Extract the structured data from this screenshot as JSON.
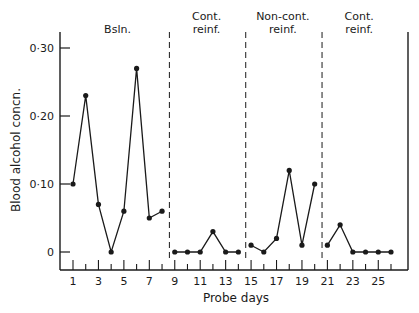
{
  "chart_data": {
    "type": "line",
    "title": "",
    "xlabel": "Probe days",
    "ylabel": "Blood alcohol concn.",
    "ylim": [
      0,
      0.3
    ],
    "xlim": [
      1,
      26
    ],
    "y_ticks": [
      0,
      0.1,
      0.2,
      0.3
    ],
    "y_tick_labels": [
      "0",
      "0·10",
      "0·20",
      "0·30"
    ],
    "x_tick_labels": [
      "1",
      "3",
      "5",
      "7",
      "9",
      "11",
      "13",
      "15",
      "17",
      "19",
      "21",
      "23",
      "25"
    ],
    "grid": false,
    "legend": null,
    "phases": [
      {
        "label_line1": "Bsln.",
        "label_line2": "",
        "days": [
          1,
          8
        ]
      },
      {
        "label_line1": "Cont.",
        "label_line2": "reinf.",
        "days": [
          9,
          14
        ]
      },
      {
        "label_line1": "Non-cont.",
        "label_line2": "reinf.",
        "days": [
          15,
          20
        ]
      },
      {
        "label_line1": "Cont.",
        "label_line2": "reinf.",
        "days": [
          21,
          26
        ]
      }
    ],
    "phase_dividers_after_day": [
      8.5,
      14.5,
      20.5
    ],
    "series": [
      {
        "name": "Bsln.",
        "x": [
          1,
          2,
          3,
          4,
          5,
          6,
          7,
          8
        ],
        "values": [
          0.1,
          0.23,
          0.07,
          0.0,
          0.06,
          0.27,
          0.05,
          0.06
        ]
      },
      {
        "name": "Cont. reinf. (1)",
        "x": [
          9,
          10,
          11,
          12,
          13,
          14
        ],
        "values": [
          0.0,
          0.0,
          0.0,
          0.03,
          0.0,
          0.0
        ]
      },
      {
        "name": "Non-cont. reinf.",
        "x": [
          15,
          16,
          17,
          18,
          19,
          20
        ],
        "values": [
          0.01,
          0.0,
          0.02,
          0.12,
          0.01,
          0.1
        ]
      },
      {
        "name": "Cont. reinf. (2)",
        "x": [
          21,
          22,
          23,
          24,
          25,
          26
        ],
        "values": [
          0.01,
          0.04,
          0.0,
          0.0,
          0.0,
          0.0
        ]
      }
    ]
  }
}
